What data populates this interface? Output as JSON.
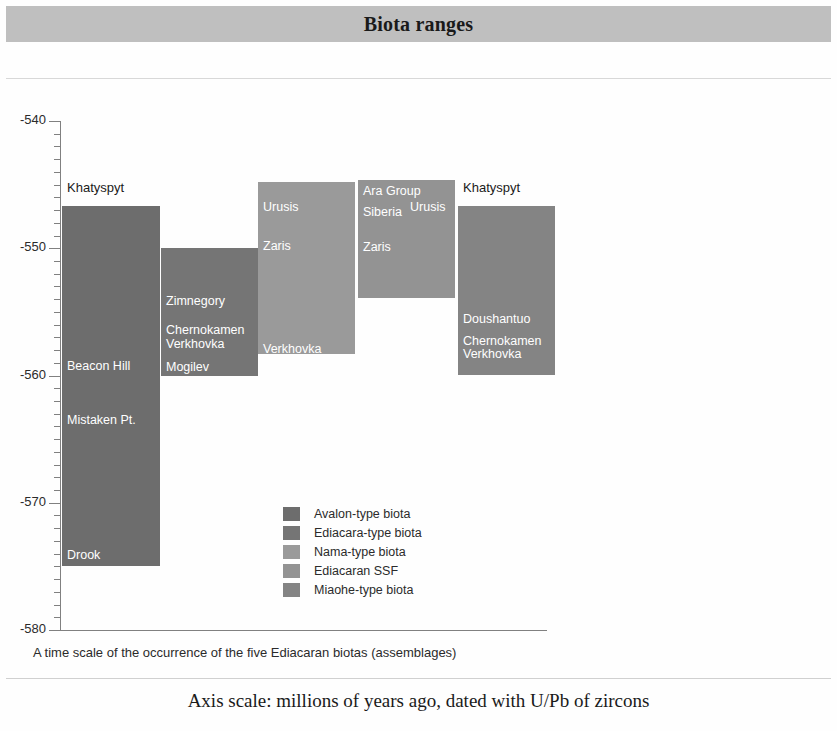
{
  "header": {
    "title": "Biota ranges"
  },
  "caption": "A time scale of the occurrence of the five Ediacaran biotas (assemblages)",
  "footnote": "Axis scale: millions of years ago, dated with U/Pb of zircons",
  "legend": {
    "items": [
      {
        "label": "Avalon-type biota",
        "color": "#6d6d6d"
      },
      {
        "label": "Ediacara-type biota",
        "color": "#757575"
      },
      {
        "label": "Nama-type biota",
        "color": "#9a9a9a"
      },
      {
        "label": "Ediacaran SSF",
        "color": "#939393"
      },
      {
        "label": "Miaohe-type biota",
        "color": "#848484"
      }
    ]
  },
  "chart_data": {
    "type": "bar",
    "title": "Biota ranges",
    "xlabel": "",
    "ylabel": "millions of years ago",
    "ylim": [
      -580,
      -540
    ],
    "yticks": [
      -540,
      -550,
      -560,
      -570,
      -580
    ],
    "ytick_labels": [
      "-540",
      "-550",
      "-560",
      "-570",
      "-580"
    ],
    "minor_tick_step": 1,
    "grid": false,
    "legend_position": "center",
    "series": [
      {
        "name": "Avalon-type biota",
        "color": "#6d6d6d",
        "start": -546.7,
        "end": -575.0,
        "annotations": [
          {
            "text": "Khatyspyt",
            "value": -546.0,
            "style": "outside"
          },
          {
            "text": "Beacon Hill",
            "value": -559.3,
            "style": "inside"
          },
          {
            "text": "Mistaken Pt.",
            "value": -563.6,
            "style": "inside"
          },
          {
            "text": "Drook",
            "value": -574.2,
            "style": "inside"
          }
        ]
      },
      {
        "name": "Ediacara-type biota",
        "color": "#757575",
        "start": -550.0,
        "end": -560.0,
        "annotations": [
          {
            "text": "Zimnegory",
            "value": -554.2,
            "style": "inside"
          },
          {
            "text": "Chernokamen",
            "value": -556.5,
            "style": "inside"
          },
          {
            "text": "Verkhovka",
            "value": -557.6,
            "style": "inside"
          },
          {
            "text": "Mogilev",
            "value": -559.4,
            "style": "inside"
          }
        ]
      },
      {
        "name": "Nama-type biota",
        "color": "#9a9a9a",
        "start": -544.8,
        "end": -558.3,
        "annotations": [
          {
            "text": "Urusis",
            "value": -546.8,
            "style": "inside"
          },
          {
            "text": "Zaris",
            "value": -549.9,
            "style": "inside"
          },
          {
            "text": "Verkhovka",
            "value": -558.0,
            "style": "inside"
          }
        ]
      },
      {
        "name": "Ediacaran SSF",
        "color": "#939393",
        "start": -544.6,
        "end": -553.9,
        "annotations": [
          {
            "text": "Ara Group",
            "value": -545.6,
            "style": "inside"
          },
          {
            "text": "Siberia",
            "value": -547.2,
            "style": "inside"
          },
          {
            "text": "Urusis",
            "value": -546.8,
            "style": "inside-right"
          },
          {
            "text": "Zaris",
            "value": -550.0,
            "style": "inside"
          }
        ]
      },
      {
        "name": "Miaohe-type biota",
        "color": "#848484",
        "start": -546.7,
        "end": -560.0,
        "annotations": [
          {
            "text": "Khatyspyt",
            "value": -546.0,
            "style": "outside"
          },
          {
            "text": "Doushantuo",
            "value": -555.6,
            "style": "inside"
          },
          {
            "text": "Chernokamen",
            "value": -557.4,
            "style": "inside"
          },
          {
            "text": "Verkhovka",
            "value": -558.4,
            "style": "inside"
          }
        ]
      }
    ]
  }
}
